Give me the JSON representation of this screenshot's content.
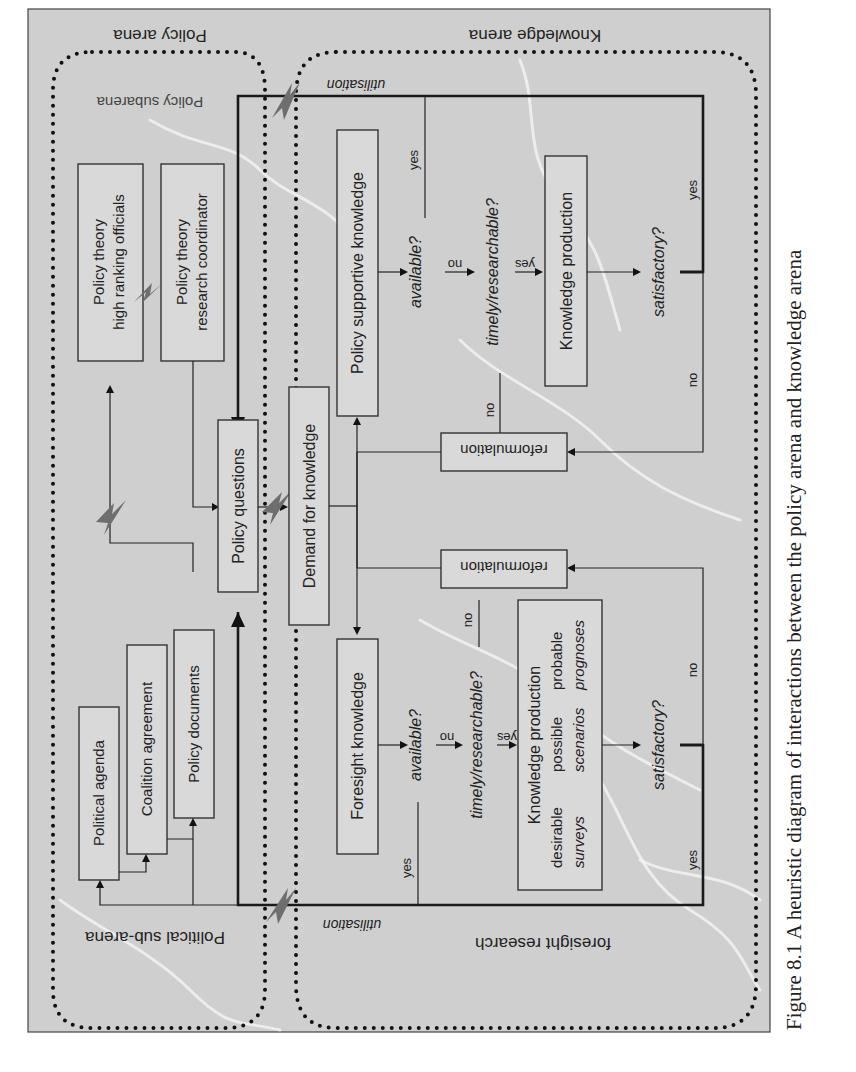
{
  "figure": {
    "caption": "Figure 8.1  A heuristic diagram of interactions between the policy arena and knowledge arena",
    "colors": {
      "background": "#cfcfcf",
      "box_fill": "#d9d9d9",
      "stroke": "#222222",
      "bolt": "#6e6e6e"
    }
  },
  "arenas": {
    "policy_arena": "Policy arena",
    "policy_subarena": "Policy subarena",
    "political_subarena": "Political sub-arena",
    "knowledge_arena": "Knowledge arena",
    "foresight_research": "foresight research"
  },
  "nodes": {
    "policy_theory_officials": [
      "Policy theory",
      "high ranking officials"
    ],
    "policy_theory_coordinator": [
      "Policy theory",
      "research coordinator"
    ],
    "political_agenda": "Political agenda",
    "coalition_agreement": "Coalition agreement",
    "policy_documents": "Policy documents",
    "policy_questions": "Policy questions",
    "demand_for_knowledge": "Demand for knowledge",
    "policy_supportive_knowledge": "Policy supportive knowledge",
    "foresight_knowledge": "Foresight knowledge",
    "knowledge_production_top": "Knowledge production",
    "knowledge_production_bottom": {
      "title": "Knowledge production",
      "row1": [
        "desirable",
        "possible",
        "probable"
      ],
      "row2": [
        "surveys",
        "scenarios",
        "prognoses"
      ]
    },
    "reformulation_top": "reformulation",
    "reformulation_bottom": "reformulation"
  },
  "decisions": {
    "available": "available?",
    "timely_researchable": "timely/researchable?",
    "satisfactory": "satisfactory?"
  },
  "edge_labels": {
    "yes": "yes",
    "no": "no",
    "utilisation": "utilisation"
  }
}
